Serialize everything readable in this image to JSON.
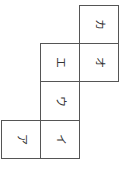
{
  "diagram": {
    "type": "cube-net",
    "text_rotation_deg": 90,
    "line_color": "#555555",
    "faces": [
      {
        "id": "a",
        "label": "ア",
        "col": 0,
        "row": 3
      },
      {
        "id": "i",
        "label": "イ",
        "col": 1,
        "row": 3
      },
      {
        "id": "u",
        "label": "ウ",
        "col": 1,
        "row": 2
      },
      {
        "id": "e",
        "label": "エ",
        "col": 1,
        "row": 1
      },
      {
        "id": "o",
        "label": "オ",
        "col": 2,
        "row": 1
      },
      {
        "id": "ka",
        "label": "カ",
        "col": 2,
        "row": 0
      }
    ]
  }
}
